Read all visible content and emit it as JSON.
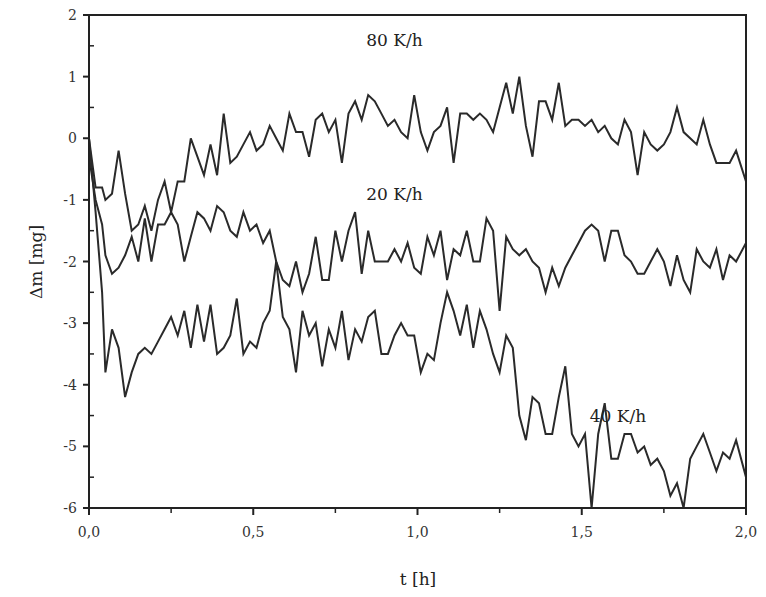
{
  "chart_data": {
    "type": "line",
    "title": "",
    "xlabel": "t [h]",
    "ylabel": "Δm [mg]",
    "xlim": [
      0,
      2.0
    ],
    "ylim": [
      -6,
      2
    ],
    "x_ticks": [
      "0,0",
      "0,5",
      "1,0",
      "1,5",
      "2,0"
    ],
    "x_tick_values": [
      0,
      0.5,
      1.0,
      1.5,
      2.0
    ],
    "y_ticks": [
      "2",
      "1",
      "0",
      "-1",
      "-2",
      "-3",
      "-4",
      "-5",
      "-6"
    ],
    "y_tick_values": [
      2,
      1,
      0,
      -1,
      -2,
      -3,
      -4,
      -5,
      -6
    ],
    "grid": false,
    "legend": "inline labels",
    "series": [
      {
        "name": "80 K/h",
        "label_pos": [
          0.93,
          1.5
        ],
        "x": [
          0,
          0.02,
          0.04,
          0.05,
          0.07,
          0.09,
          0.11,
          0.13,
          0.15,
          0.17,
          0.19,
          0.21,
          0.23,
          0.25,
          0.27,
          0.29,
          0.31,
          0.33,
          0.35,
          0.37,
          0.39,
          0.41,
          0.43,
          0.45,
          0.47,
          0.49,
          0.51,
          0.53,
          0.55,
          0.57,
          0.59,
          0.61,
          0.63,
          0.65,
          0.67,
          0.69,
          0.71,
          0.73,
          0.75,
          0.77,
          0.79,
          0.81,
          0.83,
          0.85,
          0.87,
          0.89,
          0.91,
          0.93,
          0.95,
          0.97,
          0.99,
          1.01,
          1.03,
          1.05,
          1.07,
          1.09,
          1.11,
          1.13,
          1.15,
          1.17,
          1.19,
          1.21,
          1.23,
          1.25,
          1.27,
          1.29,
          1.31,
          1.33,
          1.35,
          1.37,
          1.39,
          1.41,
          1.43,
          1.45,
          1.47,
          1.49,
          1.51,
          1.53,
          1.55,
          1.57,
          1.59,
          1.61,
          1.63,
          1.65,
          1.67,
          1.69,
          1.71,
          1.73,
          1.75,
          1.77,
          1.79,
          1.81,
          1.83,
          1.85,
          1.87,
          1.89,
          1.91,
          1.93,
          1.95,
          1.97,
          2.0
        ],
        "y": [
          0,
          -0.8,
          -0.8,
          -1.0,
          -0.9,
          -0.2,
          -0.9,
          -1.5,
          -1.4,
          -1.1,
          -1.5,
          -1.0,
          -0.7,
          -1.2,
          -0.7,
          -0.7,
          0.0,
          -0.3,
          -0.6,
          -0.1,
          -0.6,
          0.4,
          -0.4,
          -0.3,
          -0.1,
          0.1,
          -0.2,
          -0.1,
          0.2,
          0.0,
          -0.2,
          0.4,
          0.1,
          0.1,
          -0.3,
          0.3,
          0.4,
          0.1,
          0.3,
          -0.4,
          0.4,
          0.6,
          0.3,
          0.7,
          0.6,
          0.4,
          0.2,
          0.3,
          0.1,
          0.0,
          0.7,
          0.1,
          -0.2,
          0.1,
          0.2,
          0.5,
          -0.4,
          0.4,
          0.4,
          0.3,
          0.4,
          0.3,
          0.1,
          0.5,
          0.9,
          0.4,
          1.0,
          0.2,
          -0.3,
          0.6,
          0.6,
          0.3,
          0.9,
          0.2,
          0.3,
          0.3,
          0.2,
          0.3,
          0.1,
          0.2,
          0.0,
          -0.1,
          0.3,
          0.1,
          -0.6,
          0.1,
          -0.1,
          -0.2,
          -0.1,
          0.1,
          0.5,
          0.1,
          0.0,
          -0.1,
          0.3,
          -0.1,
          -0.4,
          -0.4,
          -0.4,
          -0.2,
          -0.7
        ]
      },
      {
        "name": "20 K/h",
        "label_pos": [
          0.93,
          -1.0
        ],
        "x": [
          0,
          0.02,
          0.04,
          0.05,
          0.07,
          0.09,
          0.11,
          0.13,
          0.15,
          0.17,
          0.19,
          0.21,
          0.23,
          0.25,
          0.27,
          0.29,
          0.31,
          0.33,
          0.35,
          0.37,
          0.39,
          0.41,
          0.43,
          0.45,
          0.47,
          0.49,
          0.51,
          0.53,
          0.55,
          0.57,
          0.59,
          0.61,
          0.63,
          0.65,
          0.67,
          0.69,
          0.71,
          0.73,
          0.75,
          0.77,
          0.79,
          0.81,
          0.83,
          0.85,
          0.87,
          0.89,
          0.91,
          0.93,
          0.95,
          0.97,
          0.99,
          1.01,
          1.03,
          1.05,
          1.07,
          1.09,
          1.11,
          1.13,
          1.15,
          1.17,
          1.19,
          1.21,
          1.23,
          1.25,
          1.27,
          1.29,
          1.31,
          1.33,
          1.35,
          1.37,
          1.39,
          1.41,
          1.43,
          1.45,
          1.47,
          1.49,
          1.51,
          1.53,
          1.55,
          1.57,
          1.59,
          1.61,
          1.63,
          1.65,
          1.67,
          1.69,
          1.71,
          1.73,
          1.75,
          1.77,
          1.79,
          1.81,
          1.83,
          1.85,
          1.87,
          1.89,
          1.91,
          1.93,
          1.95,
          1.97,
          2.0
        ],
        "y": [
          -0.3,
          -1.0,
          -1.4,
          -1.9,
          -2.2,
          -2.1,
          -1.9,
          -1.6,
          -2.0,
          -1.3,
          -2.0,
          -1.4,
          -1.4,
          -1.2,
          -1.4,
          -2.0,
          -1.6,
          -1.2,
          -1.3,
          -1.5,
          -1.1,
          -1.2,
          -1.5,
          -1.6,
          -1.2,
          -1.5,
          -1.4,
          -1.7,
          -1.5,
          -2.0,
          -2.3,
          -2.4,
          -2.0,
          -2.5,
          -2.2,
          -1.6,
          -2.3,
          -2.3,
          -1.5,
          -2.0,
          -1.5,
          -1.2,
          -2.2,
          -1.5,
          -2.0,
          -2.0,
          -2.0,
          -1.8,
          -2.0,
          -1.7,
          -2.1,
          -2.2,
          -1.6,
          -1.9,
          -1.5,
          -2.3,
          -1.8,
          -1.9,
          -1.5,
          -2.0,
          -2.0,
          -1.3,
          -1.5,
          -2.8,
          -1.6,
          -1.8,
          -1.9,
          -1.8,
          -2.0,
          -2.1,
          -2.5,
          -2.1,
          -2.4,
          -2.1,
          -1.9,
          -1.7,
          -1.5,
          -1.4,
          -1.5,
          -2.0,
          -1.5,
          -1.5,
          -1.9,
          -2.0,
          -2.2,
          -2.2,
          -2.0,
          -1.8,
          -2.0,
          -2.4,
          -1.9,
          -2.3,
          -2.5,
          -1.8,
          -2.0,
          -2.1,
          -1.8,
          -2.3,
          -1.9,
          -2.0,
          -1.7
        ]
      },
      {
        "name": "40 K/h",
        "label_pos": [
          1.61,
          -4.6
        ],
        "x": [
          0,
          0.02,
          0.04,
          0.05,
          0.07,
          0.09,
          0.11,
          0.13,
          0.15,
          0.17,
          0.19,
          0.21,
          0.23,
          0.25,
          0.27,
          0.29,
          0.31,
          0.33,
          0.35,
          0.37,
          0.39,
          0.41,
          0.43,
          0.45,
          0.47,
          0.49,
          0.51,
          0.53,
          0.55,
          0.57,
          0.59,
          0.61,
          0.63,
          0.65,
          0.67,
          0.69,
          0.71,
          0.73,
          0.75,
          0.77,
          0.79,
          0.81,
          0.83,
          0.85,
          0.87,
          0.89,
          0.91,
          0.93,
          0.95,
          0.97,
          0.99,
          1.01,
          1.03,
          1.05,
          1.07,
          1.09,
          1.11,
          1.13,
          1.15,
          1.17,
          1.19,
          1.21,
          1.23,
          1.25,
          1.27,
          1.29,
          1.31,
          1.33,
          1.35,
          1.37,
          1.39,
          1.41,
          1.43,
          1.45,
          1.47,
          1.49,
          1.51,
          1.53,
          1.55,
          1.57,
          1.59,
          1.61,
          1.63,
          1.65,
          1.67,
          1.69,
          1.71,
          1.73,
          1.75,
          1.77,
          1.79,
          1.81,
          1.83,
          1.85,
          1.87,
          1.89,
          1.91,
          1.93,
          1.95,
          1.97,
          2.0
        ],
        "y": [
          0,
          -1.2,
          -2.5,
          -3.8,
          -3.1,
          -3.4,
          -4.2,
          -3.8,
          -3.5,
          -3.4,
          -3.5,
          -3.3,
          -3.1,
          -2.9,
          -3.2,
          -2.8,
          -3.4,
          -2.7,
          -3.3,
          -2.7,
          -3.5,
          -3.4,
          -3.2,
          -2.6,
          -3.5,
          -3.3,
          -3.4,
          -3.0,
          -2.8,
          -2.0,
          -2.9,
          -3.1,
          -3.8,
          -2.8,
          -3.2,
          -3.0,
          -3.7,
          -3.1,
          -3.4,
          -2.8,
          -3.6,
          -3.1,
          -3.3,
          -2.9,
          -2.8,
          -3.5,
          -3.5,
          -3.2,
          -3.0,
          -3.2,
          -3.2,
          -3.8,
          -3.5,
          -3.6,
          -3.0,
          -2.5,
          -2.8,
          -3.2,
          -2.7,
          -3.4,
          -2.8,
          -3.1,
          -3.5,
          -3.8,
          -3.2,
          -3.4,
          -4.5,
          -4.9,
          -4.2,
          -4.3,
          -4.8,
          -4.8,
          -4.2,
          -3.7,
          -4.8,
          -5.0,
          -4.8,
          -6.0,
          -4.8,
          -4.3,
          -5.2,
          -5.2,
          -4.8,
          -4.8,
          -5.1,
          -5.0,
          -5.3,
          -5.2,
          -5.4,
          -5.8,
          -5.6,
          -6.0,
          -5.2,
          -5.0,
          -4.8,
          -5.1,
          -5.4,
          -5.1,
          -5.2,
          -4.9,
          -5.5
        ]
      }
    ]
  }
}
